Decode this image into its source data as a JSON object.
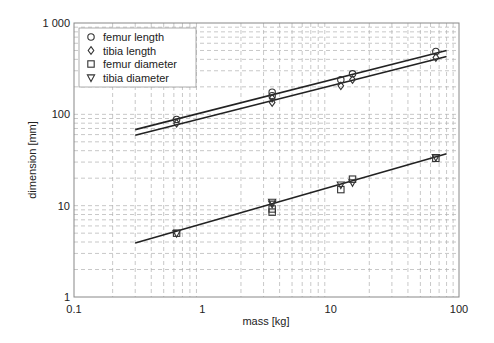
{
  "chart_data": {
    "type": "scatter",
    "title": "",
    "xlabel": "mass [kg]",
    "ylabel": "dimension [mm]",
    "xscale": "log",
    "yscale": "log",
    "xlim": [
      0.1,
      100
    ],
    "ylim": [
      1,
      1000
    ],
    "x_ticks": [
      "0.1",
      "1",
      "10",
      "100"
    ],
    "y_ticks": [
      "1",
      "10",
      "100",
      "1 000"
    ],
    "grid": true,
    "legend_position": "upper left",
    "series": [
      {
        "name": "femur length",
        "marker": "circle",
        "x": [
          0.63,
          3.5,
          3.5,
          12,
          14.8,
          66
        ],
        "y": [
          88,
          175,
          160,
          239,
          278,
          488
        ]
      },
      {
        "name": "tibia length",
        "marker": "diamond",
        "x": [
          0.63,
          3.5,
          3.5,
          12,
          14.8,
          66
        ],
        "y": [
          80,
          150,
          135,
          205,
          240,
          420
        ]
      },
      {
        "name": "femur diameter",
        "marker": "square",
        "x": [
          0.63,
          3.5,
          3.5,
          12,
          14.8,
          66
        ],
        "y": [
          5.0,
          8.5,
          9.2,
          15,
          19.5,
          33
        ]
      },
      {
        "name": "tibia diameter",
        "marker": "triangle-down",
        "x": [
          0.63,
          3.5,
          3.5,
          12,
          14.8,
          66
        ],
        "y": [
          5.0,
          10.5,
          11,
          17,
          18,
          34
        ]
      }
    ],
    "fit_lines": [
      {
        "name": "femur length fit",
        "x": [
          0.3,
          80
        ],
        "y": [
          68,
          500
        ]
      },
      {
        "name": "tibia length fit",
        "x": [
          0.3,
          80
        ],
        "y": [
          59,
          430
        ]
      },
      {
        "name": "diameter fit",
        "x": [
          0.3,
          80
        ],
        "y": [
          3.9,
          37
        ]
      }
    ]
  },
  "legend": {
    "items": [
      {
        "label": "femur length",
        "marker": "circle"
      },
      {
        "label": "tibia length",
        "marker": "diamond"
      },
      {
        "label": "femur diameter",
        "marker": "square"
      },
      {
        "label": "tibia diameter",
        "marker": "triangle-down"
      }
    ]
  },
  "axes": {
    "xlabel": "mass [kg]",
    "ylabel": "dimension [mm]"
  }
}
